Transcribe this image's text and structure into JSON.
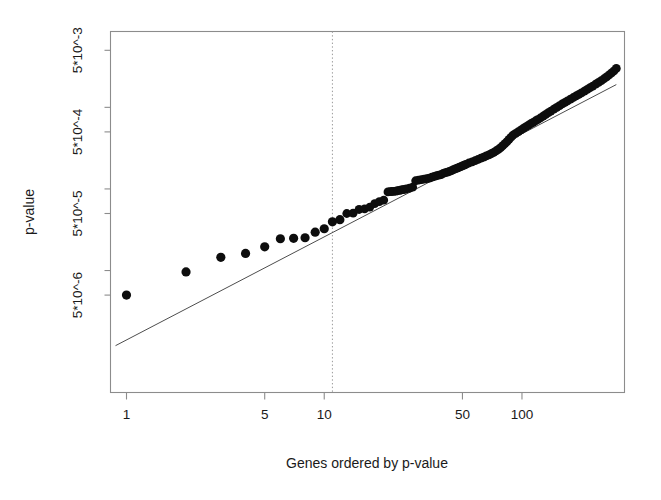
{
  "figure": {
    "background_color": "#ffffff",
    "point_color": "#111111",
    "line_color": "#4d4d4d",
    "axis_color": "#8c8c8c",
    "vline_color": "#9a9a9a"
  },
  "chart_data": {
    "type": "scatter",
    "title": "",
    "subtitle": "",
    "xlabel": "Genes ordered by p-value",
    "ylabel": "p-value",
    "xscale": "log",
    "yscale": "log",
    "grid": false,
    "legend": "none",
    "xlim": [
      0.83,
      330
    ],
    "ylim": [
      3.2e-07,
      0.0085
    ],
    "xticks": [
      1,
      5,
      10,
      50,
      100
    ],
    "xtick_labels": [
      "1",
      "5",
      "10",
      "50",
      "100"
    ],
    "yticks": [
      5e-06,
      5e-05,
      0.0005,
      0.005
    ],
    "ytick_labels": [
      "5*10^-6",
      "5*10^-5",
      "5*10^-4",
      "5*10^-3"
    ],
    "annotations": [
      {
        "kind": "vertical-dotted-line",
        "x": 11,
        "label": "significance cutoff"
      },
      {
        "kind": "reference-line",
        "x": [
          0.88,
          300
        ],
        "y": [
          1.2e-06,
          0.0019
        ],
        "label": "expected (null) line"
      }
    ],
    "series": [
      {
        "name": "observed p-values",
        "marker": "filled-circle",
        "x": [
          1,
          2,
          3,
          4,
          5,
          6,
          7,
          8,
          9,
          10,
          11,
          12,
          13,
          14,
          15,
          16,
          17,
          18,
          19,
          20,
          21,
          22,
          23,
          24,
          25,
          26,
          27,
          28,
          29,
          30,
          31,
          32,
          33,
          34,
          35,
          36,
          37,
          38,
          39,
          40,
          41,
          42,
          43,
          44,
          45,
          46,
          47,
          48,
          49,
          50,
          52,
          54,
          56,
          58,
          60,
          62,
          64,
          66,
          68,
          70,
          72,
          74,
          76,
          78,
          80,
          82,
          84,
          86,
          88,
          90,
          93,
          96,
          99,
          102,
          105,
          108,
          111,
          114,
          117,
          120,
          124,
          128,
          132,
          136,
          140,
          145,
          150,
          155,
          160,
          165,
          170,
          176,
          182,
          188,
          194,
          200,
          207,
          214,
          221,
          228,
          236,
          244,
          252,
          260,
          268,
          276,
          284,
          292,
          300
        ],
        "y": [
          5e-06,
          9.6e-06,
          1.45e-05,
          1.62e-05,
          1.95e-05,
          2.45e-05,
          2.48e-05,
          2.52e-05,
          2.95e-05,
          3.25e-05,
          3.95e-05,
          4.2e-05,
          5e-05,
          5.05e-05,
          5.6e-05,
          5.7e-05,
          6e-05,
          6.6e-05,
          7e-05,
          7.3e-05,
          9.2e-05,
          9.3e-05,
          9.4e-05,
          9.6e-05,
          9.8e-05,
          0.0001,
          0.000102,
          0.000105,
          0.000126,
          0.000128,
          0.00013,
          0.000132,
          0.000134,
          0.000136,
          0.000139,
          0.000142,
          0.000145,
          0.000148,
          0.00015,
          0.000155,
          0.000158,
          0.000161,
          0.000164,
          0.000168,
          0.000172,
          0.000176,
          0.00018,
          0.000184,
          0.000188,
          0.000192,
          0.0002,
          0.000208,
          0.000215,
          0.000222,
          0.00023,
          0.000238,
          0.000246,
          0.000254,
          0.000262,
          0.00027,
          0.00028,
          0.000292,
          0.000305,
          0.00032,
          0.00034,
          0.00036,
          0.00038,
          0.000405,
          0.00043,
          0.000455,
          0.00048,
          0.000505,
          0.00053,
          0.000555,
          0.00058,
          0.000605,
          0.00063,
          0.000655,
          0.00068,
          0.000705,
          0.00074,
          0.00078,
          0.00082,
          0.00086,
          0.0009,
          0.00095,
          0.001,
          0.00105,
          0.0011,
          0.00115,
          0.0012,
          0.00126,
          0.00132,
          0.00138,
          0.00144,
          0.0015,
          0.00158,
          0.00166,
          0.00174,
          0.00182,
          0.00192,
          0.00202,
          0.00212,
          0.00224,
          0.00236,
          0.0025,
          0.00265,
          0.0028,
          0.003
        ]
      }
    ]
  }
}
